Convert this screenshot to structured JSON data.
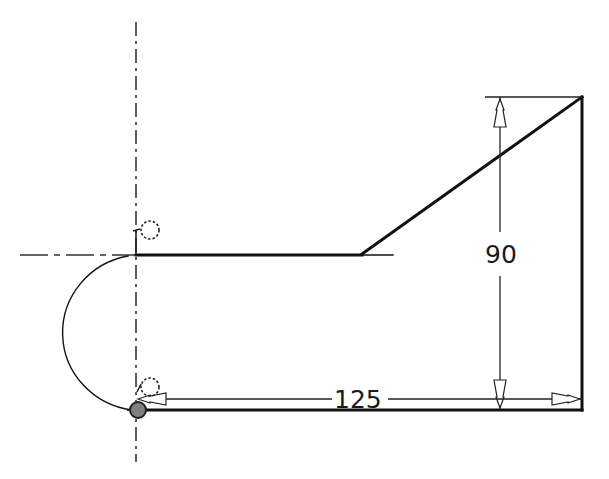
{
  "sketch": {
    "dimensions": [
      {
        "id": "dim-vertical",
        "value": "90",
        "orientation": "vertical"
      },
      {
        "id": "dim-horizontal",
        "value": "125",
        "orientation": "horizontal"
      }
    ],
    "constraints": [
      {
        "id": "tangent-top",
        "icon": "tangent-constraint-icon"
      },
      {
        "id": "tangent-bottom",
        "icon": "tangent-constraint-icon"
      }
    ],
    "colors": {
      "geometry": "#111111",
      "centerline": "#333333",
      "dimension": "#222222",
      "origin_point": "#808080"
    }
  }
}
